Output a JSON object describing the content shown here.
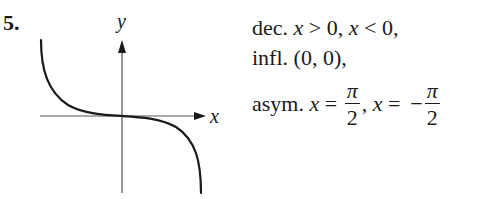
{
  "problem": {
    "number": "5."
  },
  "graph": {
    "x_axis_label": "x",
    "y_axis_label": "y",
    "curve_description": "decreasing curve through origin with vertical asymptotes on both sides (like -tan x)",
    "colors": {
      "curve": "#1a1a1a",
      "axes": "#555555"
    }
  },
  "answer": {
    "line1": {
      "prefix": "dec. ",
      "var1": "x",
      "rel1": " > 0, ",
      "var2": "x",
      "rel2": " < 0,"
    },
    "line2": {
      "text": "infl. (0, 0),"
    },
    "line3": {
      "prefix": "asym. ",
      "var1": "x",
      "eq1": " = ",
      "frac1_num": "π",
      "frac1_den": "2",
      "sep": ", ",
      "var2": "x",
      "eq2": " =  −",
      "frac2_num": "π",
      "frac2_den": "2"
    }
  }
}
